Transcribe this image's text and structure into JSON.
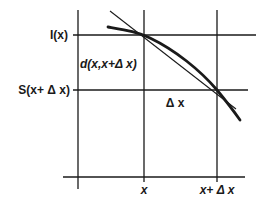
{
  "diagram": {
    "type": "function-sketch",
    "labels": {
      "y_upper": "I(x)",
      "y_lower": "S(x+ Δ x)",
      "chord": "d(x,x+Δ x)",
      "delta": "Δ x",
      "x_left": "x",
      "x_right": "x+ Δ x"
    },
    "colors": {
      "ink": "#1a1a1a",
      "background": "#ffffff"
    }
  }
}
